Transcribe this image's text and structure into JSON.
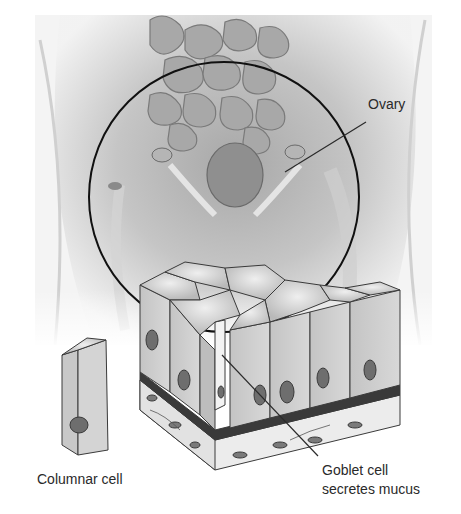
{
  "figure": {
    "labels": {
      "ovary": "Ovary",
      "columnar_cell": "Columnar cell",
      "goblet_cell_line1": "Goblet cell",
      "goblet_cell_line2": "secretes mucus"
    },
    "regions": {
      "pelvic_illustration": "Female pelvic anatomy with intestines, uterus and ovaries",
      "magnifier_circle": "Circle highlighting ovary region",
      "epithelium_block": "Simple columnar epithelium with goblet cell",
      "isolated_cell": "Single columnar cell"
    },
    "colors": {
      "background": "#ffffff",
      "outline": "#1a1a1a",
      "cell_fill": "#cfcfcf",
      "cell_top": "#dcdcdc",
      "nucleus": "#6e6e6e",
      "basement_membrane": "#3a3a3a",
      "connective_tissue": "#e8e8e8",
      "label_text": "#2a2a2a"
    }
  }
}
